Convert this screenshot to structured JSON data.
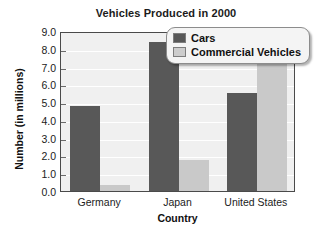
{
  "chart_data": {
    "type": "bar",
    "title": "Vehicles Produced in 2000",
    "xlabel": "Country",
    "ylabel": "Number (in millions)",
    "categories": [
      "Germany",
      "Japan",
      "United States"
    ],
    "series": [
      {
        "name": "Cars",
        "color": "#585858",
        "values": [
          4.8,
          8.4,
          5.5
        ]
      },
      {
        "name": "Commercial Vehicles",
        "color": "#c9c9c9",
        "values": [
          0.35,
          1.75,
          7.3
        ]
      }
    ],
    "ylim": [
      0.0,
      9.0
    ],
    "ytick_step": 1.0,
    "yticks": [
      "9.0",
      "8.0",
      "7.0",
      "6.0",
      "5.0",
      "4.0",
      "3.0",
      "2.0",
      "1.0",
      "0.0"
    ],
    "ytick_values": [
      9.0,
      8.0,
      7.0,
      6.0,
      5.0,
      4.0,
      3.0,
      2.0,
      1.0,
      0.0
    ],
    "grid": true,
    "grid_color": "#ffffff",
    "plot_background": "#f0f0f0",
    "legend_position": "top-right",
    "legend_entries": [
      "Cars",
      "Commercial Vehicles"
    ]
  },
  "title": {
    "text": "Vehicles Produced in 2000"
  },
  "axes": {
    "y_title": "Number (in millions)",
    "x_title": "Country"
  },
  "legend": {
    "items": [
      {
        "label": "Cars"
      },
      {
        "label": "Commercial Vehicles"
      }
    ]
  }
}
